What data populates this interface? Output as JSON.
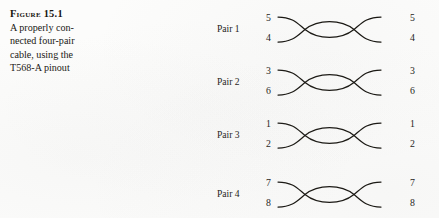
{
  "figure": {
    "label": "Figure 15.1",
    "caption_lines": [
      "A properly con-",
      "nected four-pair",
      "cable, using the",
      "T568-A pinout"
    ]
  },
  "diagram": {
    "type": "twisted-pair-wiring",
    "wire_color": "#16140f",
    "pairs": [
      {
        "name": "Pair 1",
        "left_top_pin": "5",
        "left_bottom_pin": "4",
        "right_top_pin": "5",
        "right_bottom_pin": "4"
      },
      {
        "name": "Pair 2",
        "left_top_pin": "3",
        "left_bottom_pin": "6",
        "right_top_pin": "3",
        "right_bottom_pin": "6"
      },
      {
        "name": "Pair 3",
        "left_top_pin": "1",
        "left_bottom_pin": "2",
        "right_top_pin": "1",
        "right_bottom_pin": "2"
      },
      {
        "name": "Pair 4",
        "left_top_pin": "7",
        "left_bottom_pin": "8",
        "right_top_pin": "7",
        "right_bottom_pin": "8"
      }
    ]
  }
}
